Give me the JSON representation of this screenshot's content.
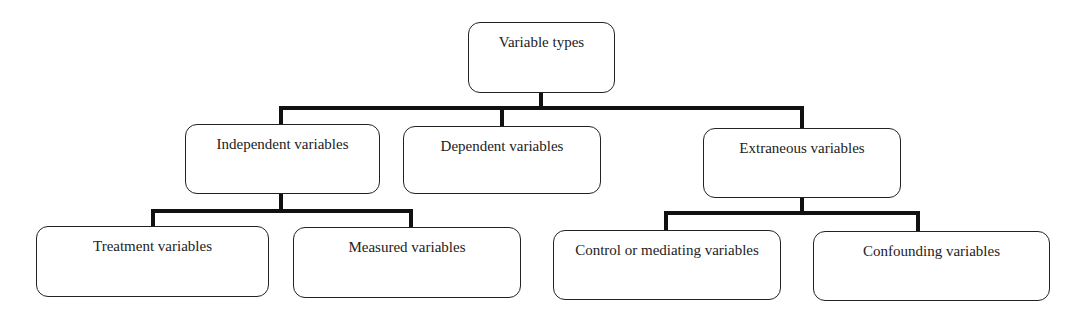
{
  "diagram": {
    "type": "hierarchy",
    "root": {
      "id": "variable-types",
      "label": "Variable types"
    },
    "level1": [
      {
        "id": "independent",
        "label": "Independent variables"
      },
      {
        "id": "dependent",
        "label": "Dependent variables"
      },
      {
        "id": "extraneous",
        "label": "Extraneous variables"
      }
    ],
    "level2": [
      {
        "id": "treatment",
        "parent": "independent",
        "label": "Treatment variables"
      },
      {
        "id": "measured",
        "parent": "independent",
        "label": "Measured variables"
      },
      {
        "id": "control",
        "parent": "extraneous",
        "label": "Control or mediating variables"
      },
      {
        "id": "confounding",
        "parent": "extraneous",
        "label": "Confounding variables"
      }
    ],
    "colors": {
      "line": "#111111",
      "box_border": "#222222",
      "text": "#222222",
      "background": "#ffffff"
    }
  }
}
